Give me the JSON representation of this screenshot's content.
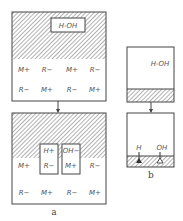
{
  "panel_a": {
    "caption": "a",
    "top": {
      "molecule": "H-OH",
      "row1": [
        "M+",
        "R−",
        "M+",
        "R−"
      ],
      "row2": [
        "R−",
        "M+",
        "R−",
        "M+"
      ]
    },
    "bottom": {
      "pocket_left": {
        "upper": "H+",
        "lower": "R−"
      },
      "pocket_right": {
        "upper": "OH−",
        "lower": "M+"
      },
      "row1_left": "M+",
      "row1_right": "R−",
      "row2": [
        "R−",
        "M+",
        "R−",
        "M+"
      ]
    }
  },
  "panel_b": {
    "caption": "b",
    "top": {
      "molecule": "H-OH"
    },
    "bottom": {
      "left_label": "H",
      "right_label": "OH"
    }
  },
  "colors": {
    "line": "#444444",
    "hatch": "#666666",
    "text": "#555555"
  }
}
